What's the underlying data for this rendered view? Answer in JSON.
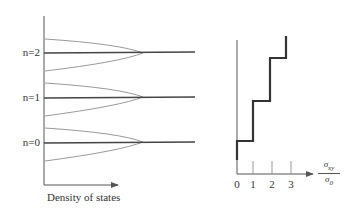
{
  "left_panel": {
    "levels": [
      {
        "label": "n=2",
        "y": 53
      },
      {
        "label": "n=1",
        "y": 97
      },
      {
        "label": "n=0",
        "y": 142
      }
    ],
    "xlabel": "Density of states"
  },
  "right_panel": {
    "ticks": [
      "0",
      "1",
      "2",
      "3"
    ],
    "ylabel_num": "σ",
    "ylabel_num_sub": "xy",
    "ylabel_den": "σ",
    "ylabel_den_sub": "0"
  },
  "colors": {
    "axis": "#555555",
    "level_line": "#444444",
    "dos_curve": "#9a9a9a",
    "step": "#333333"
  }
}
